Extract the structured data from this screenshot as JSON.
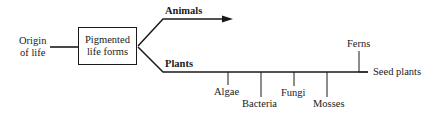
{
  "diagram": {
    "type": "evolutionary-branching-tree",
    "root": {
      "label_line1": "Origin",
      "label_line2": "of life"
    },
    "box": {
      "label_line1": "Pigmented",
      "label_line2": "life forms"
    },
    "branches": {
      "animals": {
        "label": "Animals",
        "has_arrow": true
      },
      "plants": {
        "label": "Plants",
        "end_label": "Seed plants",
        "offshoots_below": [
          {
            "label": "Algae"
          },
          {
            "label": "Bacteria"
          },
          {
            "label": "Fungi"
          },
          {
            "label": "Mosses"
          }
        ],
        "offshoots_above": [
          {
            "label": "Ferns"
          }
        ]
      }
    },
    "colors": {
      "ink": "#1a1a1a",
      "background": "#ffffff"
    }
  }
}
